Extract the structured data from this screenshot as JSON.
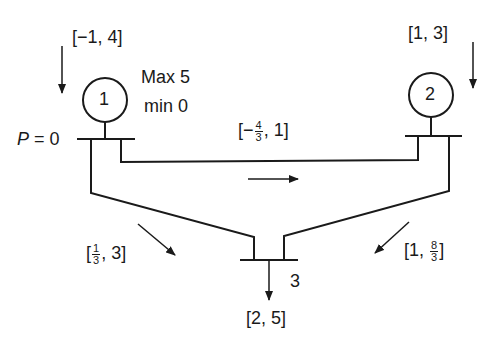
{
  "diagram": {
    "type": "power-network-three-bus",
    "buses": [
      {
        "id": "1",
        "label": "1",
        "injection_interval": "[−1, 4]",
        "limits": {
          "max_label": "Max 5",
          "min_label": "min 0"
        },
        "price_label": "P = 0"
      },
      {
        "id": "2",
        "label": "2",
        "injection_interval": "[1, 3]"
      },
      {
        "id": "3",
        "label": "3",
        "load_interval": "[2, 5]"
      }
    ],
    "lines": [
      {
        "from": "1",
        "to": "2",
        "flow_interval": {
          "open": "[",
          "prefix": "−",
          "num": "4",
          "den": "3",
          "suffix": ", 1]"
        }
      },
      {
        "from": "1",
        "to": "3",
        "flow_interval": {
          "open": "[",
          "num": "1",
          "den": "3",
          "suffix": ", 3]"
        }
      },
      {
        "from": "2",
        "to": "3",
        "flow_interval": {
          "open": "[1, ",
          "num": "8",
          "den": "3",
          "suffix": "]"
        }
      }
    ]
  },
  "colors": {
    "ink": "#1a1a1a",
    "background": "#ffffff"
  }
}
